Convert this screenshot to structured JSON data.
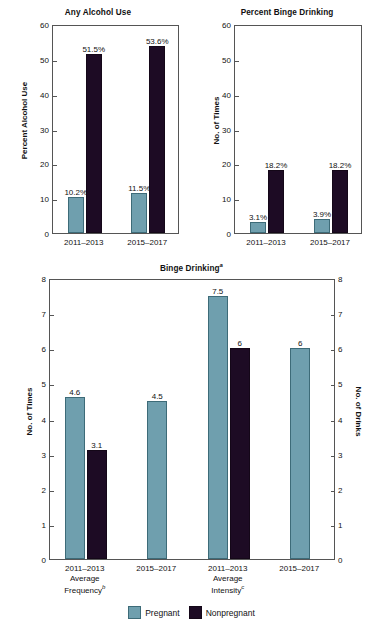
{
  "figure": {
    "legend": [
      {
        "key": "pregnant",
        "label": "Pregnant",
        "color": "#6f9fae"
      },
      {
        "key": "nonpregnant",
        "label": "Nonpregnant",
        "color": "#1d0b24"
      }
    ]
  },
  "chart_data": [
    {
      "id": "any-alcohol-use",
      "type": "bar",
      "title": "Any Alcohol Use",
      "title_sup": "",
      "xlabel": "",
      "ylabel": "Percent Alcohol Use",
      "ylim": [
        0,
        60
      ],
      "yticks": [
        0,
        10,
        20,
        30,
        40,
        50,
        60
      ],
      "ytick_labels": [
        "0",
        "10",
        "20",
        "30",
        "40",
        "50",
        "60"
      ],
      "grid": false,
      "legend_position": "figure-bottom",
      "categories": [
        "2011–2013",
        "2015–2017"
      ],
      "series": [
        {
          "name": "Pregnant",
          "color": "#6f9fae",
          "values": [
            10.2,
            11.5
          ],
          "data_labels": [
            "10.2%",
            "11.5%"
          ]
        },
        {
          "name": "Nonpregnant",
          "color": "#1d0b24",
          "values": [
            51.5,
            53.6
          ],
          "data_labels": [
            "51.5%",
            "53.6%"
          ]
        }
      ]
    },
    {
      "id": "percent-binge-drinking",
      "type": "bar",
      "title": "Percent Binge Drinking",
      "title_sup": "",
      "xlabel": "",
      "ylabel": "No. of Times",
      "ylim": [
        0,
        60
      ],
      "yticks": [
        0,
        10,
        20,
        30,
        40,
        50,
        60
      ],
      "ytick_labels": [
        "0",
        "10",
        "20",
        "30",
        "40",
        "50",
        "60"
      ],
      "grid": false,
      "legend_position": "figure-bottom",
      "categories": [
        "2011–2013",
        "2015–2017"
      ],
      "series": [
        {
          "name": "Pregnant",
          "color": "#6f9fae",
          "values": [
            3.1,
            3.9
          ],
          "data_labels": [
            "3.1%",
            "3.9%"
          ]
        },
        {
          "name": "Nonpregnant",
          "color": "#1d0b24",
          "values": [
            18.2,
            18.2
          ],
          "data_labels": [
            "18.2%",
            "18.2%"
          ]
        }
      ]
    },
    {
      "id": "binge-drinking",
      "type": "bar",
      "title": "Binge Drinking",
      "title_sup": "a",
      "xlabel": "",
      "ylabel": "No. of Times",
      "ylabel_right": "No. of Drinks",
      "ylim": [
        0,
        8
      ],
      "yticks": [
        0,
        1,
        2,
        3,
        4,
        5,
        6,
        7,
        8
      ],
      "ytick_labels": [
        "0",
        "1",
        "2",
        "3",
        "4",
        "5",
        "6",
        "7",
        "8"
      ],
      "grid": false,
      "legend_position": "bottom-center",
      "groups": [
        {
          "period": "2011–2013",
          "group": "Average Frequency",
          "group_sup": "b"
        },
        {
          "period": "2015–2017",
          "group": "",
          "group_sup": ""
        },
        {
          "period": "2011–2013",
          "group": "Average Intensity",
          "group_sup": "c"
        },
        {
          "period": "2015–2017",
          "group": "",
          "group_sup": ""
        }
      ],
      "categories": [
        "2011–2013",
        "2015–2017",
        "2011–2013",
        "2015–2017"
      ],
      "series": [
        {
          "name": "Pregnant",
          "color": "#6f9fae",
          "values": [
            4.6,
            4.5,
            7.5,
            6
          ],
          "data_labels": [
            "4.6",
            "4.5",
            "7.5",
            "6"
          ]
        },
        {
          "name": "Nonpregnant",
          "color": "#1d0b24",
          "values": [
            3.1,
            null,
            6,
            null
          ],
          "data_labels": [
            "3.1",
            "",
            "6",
            ""
          ]
        }
      ]
    }
  ]
}
